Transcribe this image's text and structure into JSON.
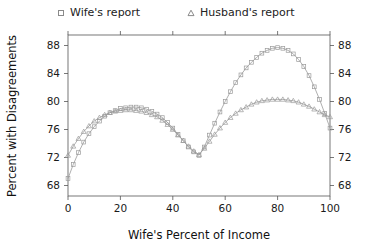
{
  "legend": {
    "entries": [
      {
        "label": "Wife's report",
        "marker": "square-open-icon",
        "color": "#8a8a8a"
      },
      {
        "label": "Husband's report",
        "marker": "triangle-open-icon",
        "color": "#8a8a8a"
      }
    ]
  },
  "chart_data": {
    "type": "line",
    "title": "",
    "xlabel": "Wife's Percent of Income",
    "ylabel": "Percent with Disagreements",
    "xlim": [
      0,
      100
    ],
    "ylim": [
      66.5,
      89.5
    ],
    "xticks": [
      0,
      20,
      40,
      60,
      80,
      100
    ],
    "yticks": [
      68,
      72,
      76,
      80,
      84,
      88
    ],
    "right_axis_ticks": [
      68,
      72,
      76,
      80,
      84,
      88
    ],
    "top_axis_ticks": [
      0,
      20,
      40,
      60,
      80,
      100
    ],
    "grid": false,
    "legend_position": "above-plot",
    "line_color": "#9a9a9a",
    "marker_size": 3,
    "series": [
      {
        "name": "Wife's report",
        "marker": "square-open",
        "x": [
          0,
          2,
          4,
          6,
          8,
          10,
          12,
          14,
          16,
          18,
          20,
          22,
          24,
          26,
          28,
          30,
          32,
          34,
          36,
          38,
          40,
          42,
          44,
          46,
          48,
          50,
          52,
          54,
          56,
          58,
          60,
          62,
          64,
          66,
          68,
          70,
          72,
          74,
          76,
          78,
          80,
          82,
          84,
          86,
          88,
          90,
          92,
          94,
          96,
          98,
          100
        ],
        "values": [
          69.0,
          71.0,
          72.7,
          74.2,
          75.4,
          76.4,
          77.2,
          77.9,
          78.4,
          78.7,
          79.0,
          79.1,
          79.2,
          79.2,
          79.1,
          78.9,
          78.6,
          78.2,
          77.7,
          77.0,
          76.2,
          75.3,
          74.4,
          73.5,
          72.8,
          72.3,
          73.5,
          75.2,
          76.9,
          78.5,
          80.0,
          81.4,
          82.7,
          83.8,
          84.8,
          85.6,
          86.3,
          86.9,
          87.3,
          87.6,
          87.7,
          87.6,
          87.3,
          86.8,
          86.0,
          85.0,
          83.7,
          82.1,
          80.3,
          78.3,
          76.2
        ]
      },
      {
        "name": "Husband's report",
        "marker": "triangle-open",
        "x": [
          0,
          2,
          4,
          6,
          8,
          10,
          12,
          14,
          16,
          18,
          20,
          22,
          24,
          26,
          28,
          30,
          32,
          34,
          36,
          38,
          40,
          42,
          44,
          46,
          48,
          50,
          52,
          54,
          56,
          58,
          60,
          62,
          64,
          66,
          68,
          70,
          72,
          74,
          76,
          78,
          80,
          82,
          84,
          86,
          88,
          90,
          92,
          94,
          96,
          98,
          100
        ],
        "values": [
          72.3,
          73.6,
          74.7,
          75.7,
          76.5,
          77.2,
          77.7,
          78.1,
          78.4,
          78.6,
          78.7,
          78.8,
          78.8,
          78.7,
          78.6,
          78.4,
          78.1,
          77.8,
          77.3,
          76.7,
          76.0,
          75.2,
          74.4,
          73.6,
          72.9,
          72.4,
          73.3,
          74.3,
          75.3,
          76.2,
          77.0,
          77.7,
          78.3,
          78.8,
          79.2,
          79.6,
          79.9,
          80.1,
          80.2,
          80.3,
          80.3,
          80.3,
          80.2,
          80.1,
          79.9,
          79.6,
          79.3,
          78.9,
          78.5,
          78.1,
          77.8
        ]
      }
    ]
  }
}
